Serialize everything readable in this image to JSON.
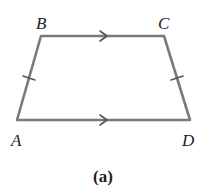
{
  "figure": {
    "caption": "(a)",
    "shape": "isosceles trapezoid",
    "vertices": [
      {
        "name": "A",
        "x": 17,
        "y": 120
      },
      {
        "name": "B",
        "x": 41,
        "y": 36
      },
      {
        "name": "C",
        "x": 164,
        "y": 36
      },
      {
        "name": "D",
        "x": 190,
        "y": 120
      }
    ],
    "labels": {
      "A": "A",
      "B": "B",
      "C": "C",
      "D": "D"
    },
    "markings": {
      "parallel_sides": [
        "BC",
        "AD"
      ],
      "parallel_marker": "single-arrow",
      "congruent_sides": [
        "AB",
        "CD"
      ],
      "congruent_marker": "single-tick"
    },
    "colors": {
      "edge": "#7a7a7a",
      "text": "#222222",
      "background": "#ffffff"
    }
  }
}
